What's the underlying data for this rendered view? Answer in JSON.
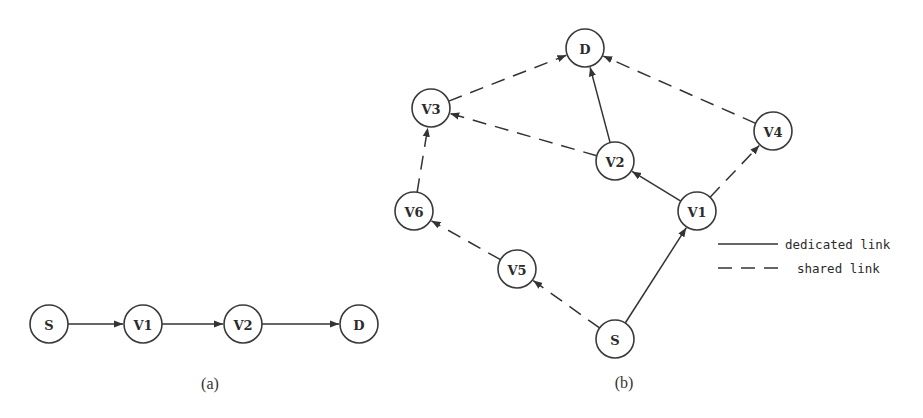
{
  "figure": {
    "colors": {
      "stroke": "#333333",
      "node_fill": "#ffffff",
      "background": "#ffffff"
    },
    "node_radius": 19
  },
  "subfigure_a": {
    "caption": "(a)",
    "caption_pos": [
      210,
      383
    ],
    "nodes": [
      {
        "id": "S",
        "label": "S",
        "x": 49,
        "y": 324
      },
      {
        "id": "V1",
        "label": "V1",
        "x": 143,
        "y": 324
      },
      {
        "id": "V2",
        "label": "V2",
        "x": 243,
        "y": 324
      },
      {
        "id": "D",
        "label": "D",
        "x": 359,
        "y": 324
      }
    ],
    "edges": [
      {
        "from": "S",
        "to": "V1",
        "type": "dedicated"
      },
      {
        "from": "V1",
        "to": "V2",
        "type": "dedicated"
      },
      {
        "from": "V2",
        "to": "D",
        "type": "dedicated"
      }
    ]
  },
  "subfigure_b": {
    "caption": "(b)",
    "caption_pos": [
      624,
      382
    ],
    "nodes": [
      {
        "id": "D",
        "label": "D",
        "x": 585,
        "y": 48
      },
      {
        "id": "V3",
        "label": "V3",
        "x": 431,
        "y": 108
      },
      {
        "id": "V4",
        "label": "V4",
        "x": 773,
        "y": 131
      },
      {
        "id": "V2",
        "label": "V2",
        "x": 615,
        "y": 161
      },
      {
        "id": "V6",
        "label": "V6",
        "x": 414,
        "y": 211
      },
      {
        "id": "V1",
        "label": "V1",
        "x": 697,
        "y": 211
      },
      {
        "id": "V5",
        "label": "V5",
        "x": 517,
        "y": 269
      },
      {
        "id": "S",
        "label": "S",
        "x": 615,
        "y": 339
      }
    ],
    "edges": [
      {
        "from": "S",
        "to": "V1",
        "type": "dedicated"
      },
      {
        "from": "V1",
        "to": "V2",
        "type": "dedicated"
      },
      {
        "from": "V2",
        "to": "D",
        "type": "dedicated"
      },
      {
        "from": "V1",
        "to": "V4",
        "type": "shared"
      },
      {
        "from": "V4",
        "to": "D",
        "type": "shared"
      },
      {
        "from": "V2",
        "to": "V3",
        "type": "shared"
      },
      {
        "from": "V3",
        "to": "D",
        "type": "shared"
      },
      {
        "from": "S",
        "to": "V5",
        "type": "shared"
      },
      {
        "from": "V5",
        "to": "V6",
        "type": "shared"
      },
      {
        "from": "V6",
        "to": "V3",
        "type": "shared"
      }
    ]
  },
  "legend": {
    "items": [
      {
        "type": "dedicated",
        "label": "dedicated link",
        "line": [
          718,
          244,
          778,
          244
        ],
        "text_pos": [
          785,
          244
        ]
      },
      {
        "type": "shared",
        "label": "shared link",
        "line": [
          718,
          268,
          778,
          268
        ],
        "text_pos": [
          797,
          268
        ]
      }
    ]
  }
}
